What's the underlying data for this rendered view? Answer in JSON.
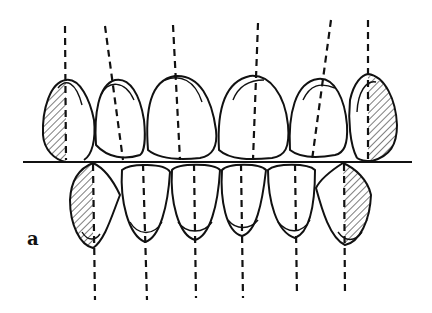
{
  "figure": {
    "panel_label": "a",
    "upper_teeth": [
      "right canine",
      "right lateral incisor",
      "right central incisor",
      "left central incisor",
      "left lateral incisor",
      "left canine"
    ],
    "lower_teeth": [
      "right canine",
      "right lateral incisor",
      "right central incisor",
      "left central incisor",
      "left lateral incisor",
      "left canine"
    ],
    "hatched_teeth": [
      "upper right canine",
      "upper left canine",
      "lower right canine",
      "lower left canine"
    ],
    "elements": {
      "occlusal_plane": "horizontal reference line",
      "axis_lines": "dashed long-axis lines through each tooth"
    },
    "colors": {
      "ink": "#111111",
      "background": "#ffffff"
    }
  }
}
